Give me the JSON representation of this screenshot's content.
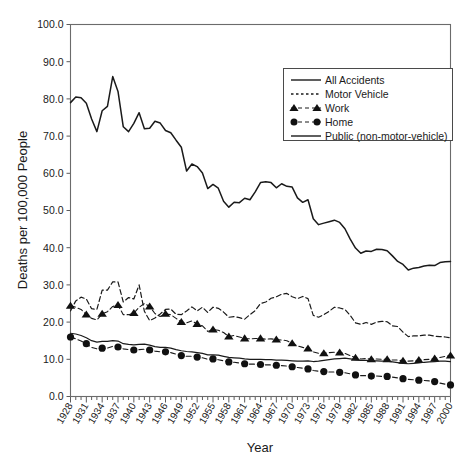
{
  "chart_data": {
    "type": "line",
    "title": "",
    "xlabel": "Year",
    "ylabel": "Deaths per 100,000 People",
    "ylim": [
      0.0,
      100.0
    ],
    "xlim": [
      1928,
      2000
    ],
    "grid": false,
    "legend_position": "top-right",
    "y_ticks": [
      "0.0",
      "10.0",
      "20.0",
      "30.0",
      "40.0",
      "50.0",
      "60.0",
      "70.0",
      "80.0",
      "90.0",
      "100.0"
    ],
    "y_tick_values": [
      0,
      10,
      20,
      30,
      40,
      50,
      60,
      70,
      80,
      90,
      100
    ],
    "x_tick_labels": [
      "1928",
      "1931",
      "1934",
      "1937",
      "1940",
      "1943",
      "1946",
      "1949",
      "1952",
      "1955",
      "1958",
      "1961",
      "1964",
      "1967",
      "1970",
      "1973",
      "1976",
      "1979",
      "1982",
      "1985",
      "1988",
      "1991",
      "1994",
      "1997",
      "2000"
    ],
    "x_tick_values": [
      1928,
      1931,
      1934,
      1937,
      1940,
      1943,
      1946,
      1949,
      1952,
      1955,
      1958,
      1961,
      1964,
      1967,
      1970,
      1973,
      1976,
      1979,
      1982,
      1985,
      1988,
      1991,
      1994,
      1997,
      2000
    ],
    "x": [
      1928,
      1929,
      1930,
      1931,
      1932,
      1933,
      1934,
      1935,
      1936,
      1937,
      1938,
      1939,
      1940,
      1941,
      1942,
      1943,
      1944,
      1945,
      1946,
      1947,
      1948,
      1949,
      1950,
      1951,
      1952,
      1953,
      1954,
      1955,
      1956,
      1957,
      1958,
      1959,
      1960,
      1961,
      1962,
      1963,
      1964,
      1965,
      1966,
      1967,
      1968,
      1969,
      1970,
      1971,
      1972,
      1973,
      1974,
      1975,
      1976,
      1977,
      1978,
      1979,
      1980,
      1981,
      1982,
      1983,
      1984,
      1985,
      1986,
      1987,
      1988,
      1989,
      1990,
      1991,
      1992,
      1993,
      1994,
      1995,
      1996,
      1997,
      1998,
      1999,
      2000
    ],
    "series": [
      {
        "name": "All Accidents",
        "style": "solid",
        "marker": "none",
        "color": "#1a1a1a",
        "values": [
          79.0,
          80.5,
          80.3,
          78.8,
          74.6,
          71.2,
          76.8,
          78.0,
          86.0,
          82.0,
          72.5,
          71.2,
          73.4,
          76.3,
          72.0,
          72.1,
          74.0,
          73.5,
          71.5,
          70.9,
          68.9,
          67.0,
          60.6,
          62.5,
          61.8,
          60.1,
          55.9,
          57.0,
          56.0,
          52.5,
          50.9,
          52.2,
          52.1,
          53.3,
          52.9,
          55.0,
          57.5,
          57.7,
          57.5,
          56.1,
          57.2,
          56.5,
          56.3,
          53.4,
          52.2,
          52.9,
          47.8,
          46.2,
          46.6,
          47.0,
          47.4,
          46.8,
          45.1,
          42.3,
          39.9,
          38.5,
          39.1,
          39.0,
          39.6,
          39.5,
          39.2,
          37.8,
          36.3,
          35.5,
          34.0,
          34.5,
          34.7,
          35.1,
          35.3,
          35.2,
          36.0,
          36.2,
          36.3
        ]
      },
      {
        "name": "Motor Vehicle",
        "style": "dashed",
        "marker": "none",
        "color": "#1a1a1a",
        "values": [
          23.0,
          25.7,
          26.7,
          26.2,
          23.6,
          23.4,
          28.6,
          28.6,
          30.8,
          30.8,
          25.4,
          26.6,
          26.2,
          30.0,
          22.9,
          20.4,
          21.1,
          22.2,
          23.4,
          23.5,
          22.1,
          22.0,
          23.0,
          24.1,
          23.0,
          24.0,
          22.6,
          24.0,
          23.7,
          22.7,
          21.3,
          21.5,
          21.2,
          20.8,
          22.0,
          23.1,
          25.0,
          25.4,
          26.4,
          26.8,
          27.5,
          27.7,
          26.8,
          26.3,
          26.9,
          26.3,
          21.8,
          21.3,
          22.0,
          22.9,
          24.0,
          23.8,
          23.4,
          21.8,
          19.8,
          19.4,
          19.9,
          19.4,
          20.0,
          20.2,
          20.1,
          19.0,
          18.8,
          17.3,
          16.1,
          16.3,
          16.3,
          16.5,
          16.5,
          16.2,
          16.1,
          16.0,
          15.8
        ]
      },
      {
        "name": "Work",
        "style": "dashed",
        "marker": "triangle",
        "color": "#1a1a1a",
        "values": [
          24.4,
          24.0,
          23.4,
          22.0,
          21.0,
          20.6,
          22.2,
          22.8,
          24.2,
          24.6,
          22.0,
          22.0,
          22.4,
          24.0,
          25.0,
          24.2,
          22.3,
          21.5,
          22.2,
          22.0,
          21.0,
          20.0,
          19.8,
          20.3,
          19.5,
          19.0,
          17.5,
          18.0,
          17.8,
          17.2,
          16.1,
          16.4,
          16.0,
          15.6,
          15.5,
          15.6,
          15.6,
          15.4,
          15.5,
          15.3,
          15.2,
          15.0,
          14.3,
          13.6,
          13.2,
          12.9,
          12.0,
          11.6,
          11.6,
          11.8,
          11.9,
          11.8,
          11.6,
          11.0,
          10.4,
          10.1,
          10.2,
          10.0,
          10.1,
          10.0,
          10.0,
          9.8,
          9.8,
          9.6,
          9.5,
          9.6,
          9.8,
          9.9,
          10.0,
          10.2,
          10.5,
          10.8,
          11.0
        ]
      },
      {
        "name": "Home",
        "style": "dashed",
        "marker": "circle",
        "color": "#111111",
        "values": [
          16.0,
          15.5,
          14.9,
          14.2,
          13.2,
          12.8,
          13.0,
          13.0,
          13.5,
          13.3,
          12.8,
          12.6,
          12.5,
          12.6,
          12.7,
          12.5,
          12.2,
          12.0,
          12.0,
          11.8,
          11.4,
          11.0,
          10.8,
          10.8,
          10.6,
          10.4,
          10.0,
          10.1,
          9.9,
          9.6,
          9.3,
          9.2,
          9.0,
          8.8,
          8.7,
          8.7,
          8.6,
          8.5,
          8.5,
          8.4,
          8.3,
          8.2,
          8.0,
          7.8,
          7.6,
          7.4,
          7.0,
          6.8,
          6.7,
          6.6,
          6.6,
          6.5,
          6.4,
          6.1,
          5.8,
          5.6,
          5.6,
          5.5,
          5.5,
          5.4,
          5.4,
          5.2,
          5.0,
          4.8,
          4.6,
          4.5,
          4.4,
          4.3,
          4.2,
          4.0,
          3.6,
          3.3,
          3.1
        ]
      },
      {
        "name": "Public (non-motor-vehicle)",
        "style": "solid",
        "marker": "none",
        "color": "#2a2a2a",
        "values": [
          17.0,
          16.8,
          16.4,
          15.8,
          15.0,
          14.6,
          14.8,
          14.8,
          15.0,
          14.9,
          14.2,
          14.0,
          13.9,
          14.0,
          14.1,
          13.8,
          13.4,
          13.2,
          13.2,
          13.0,
          12.6,
          12.3,
          12.1,
          12.0,
          11.8,
          11.6,
          11.2,
          11.2,
          11.1,
          10.8,
          10.5,
          10.4,
          10.3,
          10.1,
          10.0,
          10.0,
          10.0,
          9.9,
          9.9,
          9.8,
          9.8,
          9.7,
          9.6,
          9.5,
          9.5,
          9.6,
          9.4,
          9.5,
          9.7,
          9.9,
          10.1,
          10.2,
          10.3,
          10.1,
          9.9,
          9.7,
          9.7,
          9.6,
          9.6,
          9.5,
          9.5,
          9.3,
          9.1,
          8.9,
          8.8,
          8.9,
          9.0,
          9.2,
          9.3,
          9.4,
          9.5,
          9.5,
          9.4
        ]
      }
    ]
  },
  "legend": {
    "entries": [
      {
        "label": "All Accidents",
        "style": "solid",
        "marker": "none"
      },
      {
        "label": "Motor Vehicle",
        "style": "dotted",
        "marker": "none"
      },
      {
        "label": "Work",
        "style": "dashed",
        "marker": "triangle"
      },
      {
        "label": "Home",
        "style": "dashed",
        "marker": "circle"
      },
      {
        "label": "Public (non-motor-vehicle)",
        "style": "solid",
        "marker": "none"
      }
    ]
  }
}
